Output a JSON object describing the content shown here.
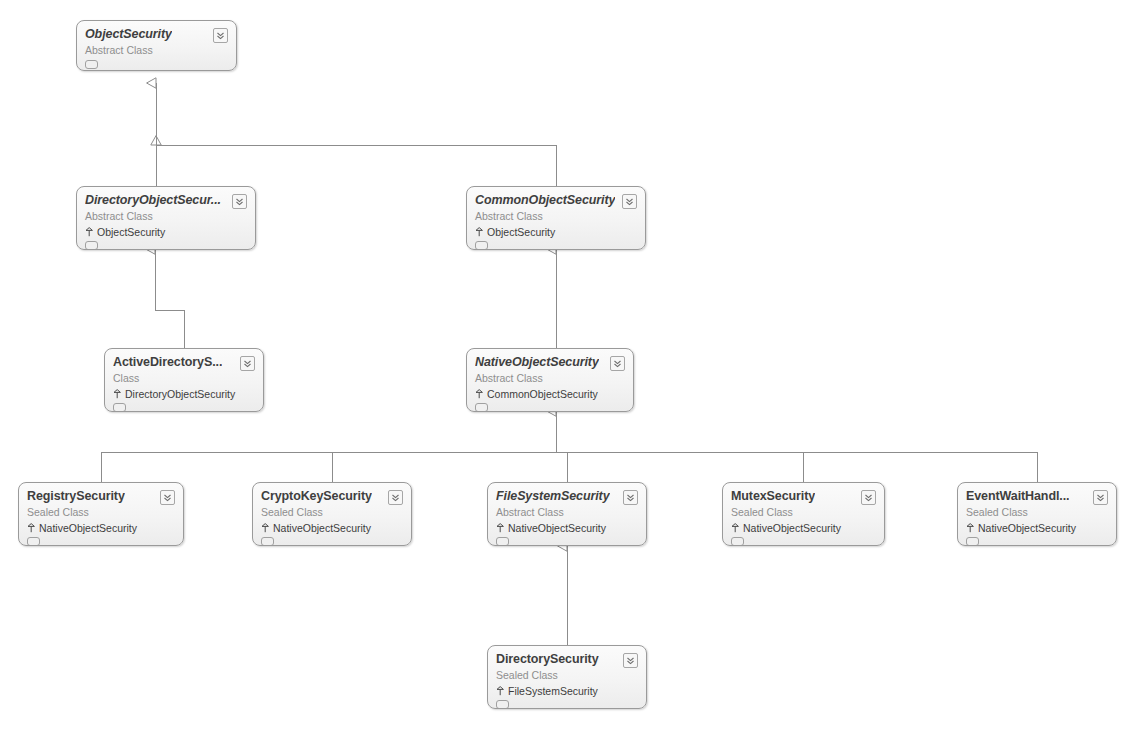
{
  "diagram": {
    "type": "uml-class-diagram",
    "colors": {
      "shape_border": "#9a9a9a",
      "shape_fill_top": "#fbfbfb",
      "shape_fill_bottom": "#ececec",
      "title_text": "#3f3f3f",
      "stereotype_text": "#8e8e8e",
      "connector": "#8c8c8c",
      "canvas": "#ffffff"
    },
    "icons": {
      "expander": "chevron-double-down-icon",
      "base_class": "inheritance-arrow-icon",
      "compartment": "collapsed-compartment-icon"
    }
  },
  "classes": [
    {
      "id": "object-security",
      "name": "ObjectSecurity",
      "stereotype": "Abstract Class",
      "abstract": true,
      "base": null,
      "x": 76,
      "y": 20,
      "w": 161,
      "h": 51
    },
    {
      "id": "directory-object-security",
      "name": "DirectoryObjectSecur...",
      "stereotype": "Abstract Class",
      "abstract": true,
      "base": "ObjectSecurity",
      "x": 76,
      "y": 186,
      "w": 180,
      "h": 64
    },
    {
      "id": "common-object-security",
      "name": "CommonObjectSecurity",
      "stereotype": "Abstract Class",
      "abstract": true,
      "base": "ObjectSecurity",
      "x": 466,
      "y": 186,
      "w": 180,
      "h": 64
    },
    {
      "id": "active-directory-security",
      "name": "ActiveDirectoryS...",
      "stereotype": "Class",
      "abstract": false,
      "base": "DirectoryObjectSecurity",
      "x": 104,
      "y": 348,
      "w": 160,
      "h": 64
    },
    {
      "id": "native-object-security",
      "name": "NativeObjectSecurity",
      "stereotype": "Abstract Class",
      "abstract": true,
      "base": "CommonObjectSecurity",
      "x": 466,
      "y": 348,
      "w": 168,
      "h": 64
    },
    {
      "id": "registry-security",
      "name": "RegistrySecurity",
      "stereotype": "Sealed Class",
      "abstract": false,
      "base": "NativeObjectSecurity",
      "x": 18,
      "y": 482,
      "w": 166,
      "h": 64
    },
    {
      "id": "crypto-key-security",
      "name": "CryptoKeySecurity",
      "stereotype": "Sealed Class",
      "abstract": false,
      "base": "NativeObjectSecurity",
      "x": 252,
      "y": 482,
      "w": 160,
      "h": 64
    },
    {
      "id": "file-system-security",
      "name": "FileSystemSecurity",
      "stereotype": "Abstract Class",
      "abstract": true,
      "base": "NativeObjectSecurity",
      "x": 487,
      "y": 482,
      "w": 160,
      "h": 64
    },
    {
      "id": "mutex-security",
      "name": "MutexSecurity",
      "stereotype": "Sealed Class",
      "abstract": false,
      "base": "NativeObjectSecurity",
      "x": 722,
      "y": 482,
      "w": 163,
      "h": 64
    },
    {
      "id": "event-wait-handle-security",
      "name": "EventWaitHandl...",
      "stereotype": "Sealed Class",
      "abstract": false,
      "base": "NativeObjectSecurity",
      "x": 957,
      "y": 482,
      "w": 160,
      "h": 64
    },
    {
      "id": "directory-security",
      "name": "DirectorySecurity",
      "stereotype": "Sealed Class",
      "abstract": false,
      "base": "FileSystemSecurity",
      "x": 487,
      "y": 645,
      "w": 160,
      "h": 64
    }
  ],
  "connectors": [
    {
      "from": "directory-object-security",
      "to": "object-security",
      "kind": "inheritance"
    },
    {
      "from": "common-object-security",
      "to": "object-security",
      "kind": "inheritance"
    },
    {
      "from": "active-directory-security",
      "to": "directory-object-security",
      "kind": "inheritance"
    },
    {
      "from": "native-object-security",
      "to": "common-object-security",
      "kind": "inheritance"
    },
    {
      "from": "registry-security",
      "to": "native-object-security",
      "kind": "inheritance"
    },
    {
      "from": "crypto-key-security",
      "to": "native-object-security",
      "kind": "inheritance"
    },
    {
      "from": "file-system-security",
      "to": "native-object-security",
      "kind": "inheritance"
    },
    {
      "from": "mutex-security",
      "to": "native-object-security",
      "kind": "inheritance"
    },
    {
      "from": "event-wait-handle-security",
      "to": "native-object-security",
      "kind": "inheritance"
    },
    {
      "from": "directory-security",
      "to": "file-system-security",
      "kind": "inheritance"
    }
  ]
}
